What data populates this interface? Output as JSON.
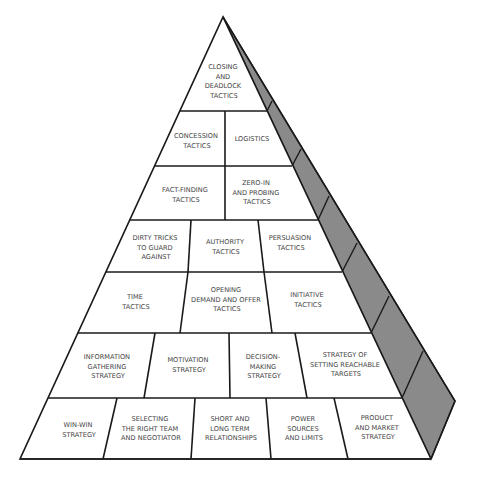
{
  "diagram": {
    "type": "pyramid",
    "colors": {
      "face": "#ffffff",
      "side_shade": "#8a8a8a",
      "lines": "#1a1a1a",
      "text": "#444444"
    },
    "levels": [
      {
        "row": 1,
        "cells": [
          {
            "lines": [
              "CLOSING",
              "AND",
              "DEADLOCK",
              "TACTICS"
            ]
          }
        ]
      },
      {
        "row": 2,
        "cells": [
          {
            "lines": [
              "CONCESSION",
              "TACTICS"
            ]
          },
          {
            "lines": [
              "LOGISTICS"
            ]
          }
        ]
      },
      {
        "row": 3,
        "cells": [
          {
            "lines": [
              "FACT-FINDING",
              "TACTICS"
            ]
          },
          {
            "lines": [
              "ZERO-IN",
              "AND PROBING",
              "TACTICS"
            ]
          }
        ]
      },
      {
        "row": 4,
        "cells": [
          {
            "lines": [
              "DIRTY TRICKS",
              "TO GUARD",
              "AGAINST"
            ]
          },
          {
            "lines": [
              "AUTHORITY",
              "TACTICS"
            ]
          },
          {
            "lines": [
              "PERSUASION",
              "TACTICS"
            ]
          }
        ]
      },
      {
        "row": 5,
        "cells": [
          {
            "lines": [
              "TIME",
              "TACTICS"
            ]
          },
          {
            "lines": [
              "OPENING",
              "DEMAND AND OFFER",
              "TACTICS"
            ]
          },
          {
            "lines": [
              "INITIATIVE",
              "TACTICS"
            ]
          }
        ]
      },
      {
        "row": 6,
        "cells": [
          {
            "lines": [
              "INFORMATION",
              "GATHERING",
              "STRATEGY"
            ]
          },
          {
            "lines": [
              "MOTIVATION",
              "STRATEGY"
            ]
          },
          {
            "lines": [
              "DECISION-",
              "MAKING",
              "STRATEGY"
            ]
          },
          {
            "lines": [
              "STRATEGY OF",
              "SETTING REACHABLE",
              "TARGETS"
            ]
          }
        ]
      },
      {
        "row": 7,
        "cells": [
          {
            "lines": [
              "WIN-WIN",
              "STRATEGY"
            ]
          },
          {
            "lines": [
              "SELECTING",
              "THE RIGHT TEAM",
              "AND NEGOTIATOR"
            ]
          },
          {
            "lines": [
              "SHORT AND",
              "LONG TERM",
              "RELATIONSHIPS"
            ]
          },
          {
            "lines": [
              "POWER",
              "SOURCES",
              "AND LIMITS"
            ]
          },
          {
            "lines": [
              "PRODUCT",
              "AND MARKET",
              "STRATEGY"
            ]
          }
        ]
      }
    ]
  }
}
